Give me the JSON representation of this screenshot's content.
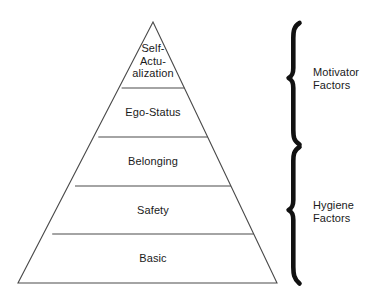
{
  "diagram": {
    "background_color": "#ffffff",
    "line_color": "#4a4a4a",
    "brace_color": "#111111",
    "text_color": "#1a1a1a"
  },
  "pyramid": {
    "apex": {
      "x": 153,
      "y": 22
    },
    "base_left": {
      "x": 18,
      "y": 283
    },
    "base_right": {
      "x": 277,
      "y": 283
    },
    "divider_y": [
      88,
      137,
      186,
      234
    ],
    "tiers": [
      {
        "id": "self-actualization",
        "label": "Self-\nActu-\nalization",
        "label_x": 153,
        "label_y": 42,
        "level": 5
      },
      {
        "id": "ego-status",
        "label": "Ego-Status",
        "label_x": 153,
        "label_y": 106,
        "level": 4
      },
      {
        "id": "belonging",
        "label": "Belonging",
        "label_x": 153,
        "label_y": 155,
        "level": 3
      },
      {
        "id": "safety",
        "label": "Safety",
        "label_x": 153,
        "label_y": 204,
        "level": 2
      },
      {
        "id": "basic",
        "label": "Basic",
        "label_x": 153,
        "label_y": 252,
        "level": 1
      }
    ]
  },
  "brackets": [
    {
      "id": "motivator",
      "label": "Motivator\nFactors",
      "top_y": 22,
      "bottom_y": 145,
      "mid_y": 78,
      "label_x": 313,
      "label_y": 66,
      "covers": [
        "self-actualization",
        "ego-status"
      ]
    },
    {
      "id": "hygiene",
      "label": "Hygiene\nFactors",
      "top_y": 146,
      "bottom_y": 285,
      "mid_y": 210,
      "label_x": 313,
      "label_y": 199,
      "covers": [
        "belonging",
        "safety",
        "basic"
      ]
    }
  ]
}
